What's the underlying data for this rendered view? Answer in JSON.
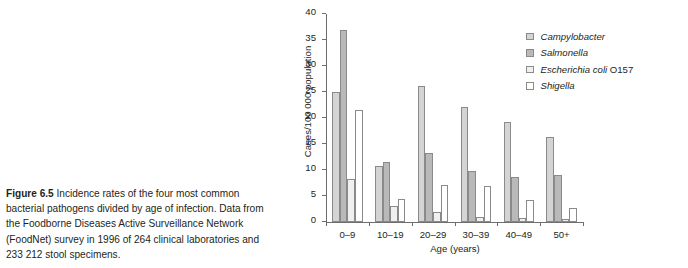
{
  "caption": {
    "label": "Figure 6.5",
    "text": " Incidence rates of the four most common bacterial pathogens divided by age of infection. Data from the Foodborne Diseases Active Surveillance Network (FoodNet) survey in 1996 of 264 clinical laboratories and 233 212 stool specimens."
  },
  "chart_data": {
    "type": "bar",
    "title": "",
    "xlabel": "Age (years)",
    "ylabel": "Cases/100 000 population",
    "categories": [
      "0–9",
      "10–19",
      "20–29",
      "30–39",
      "40–49",
      "50+"
    ],
    "ylim": [
      0,
      40
    ],
    "yticks": [
      0,
      5,
      10,
      15,
      20,
      25,
      30,
      35,
      40
    ],
    "ytick_labels": [
      "0",
      "5",
      "10",
      "15",
      "20",
      "25",
      "30",
      "35",
      "40"
    ],
    "grid": false,
    "legend_position": "top-right",
    "series": [
      {
        "name": "Campylobacter",
        "italic": true,
        "color": "#d4d4d4",
        "border": "#8a8a8a",
        "values": [
          25.0,
          10.8,
          26.2,
          22.1,
          19.2,
          16.3
        ]
      },
      {
        "name": "Salmonella",
        "italic": true,
        "color": "#b9b9b9",
        "border": "#8a8a8a",
        "values": [
          37.0,
          11.5,
          13.2,
          9.8,
          8.6,
          9.0
        ]
      },
      {
        "name": "Escherichia coli O157",
        "italic": true,
        "roman_suffix": " O157",
        "color": "#f0f0f0",
        "border": "#8a8a8a",
        "values": [
          8.3,
          3.1,
          1.9,
          0.9,
          0.7,
          0.6
        ]
      },
      {
        "name": "Shigella",
        "italic": true,
        "color": "#ffffff",
        "border": "#8a8a8a",
        "values": [
          21.5,
          4.5,
          7.2,
          6.9,
          4.2,
          2.6
        ]
      }
    ]
  },
  "legend": {
    "items": [
      {
        "label": "Campylobacter",
        "swatch": "#d4d4d4"
      },
      {
        "label": "Salmonella",
        "swatch": "#b9b9b9"
      },
      {
        "label": "Escherichia coli O157",
        "swatch": "#f0f0f0"
      },
      {
        "label": "Shigella",
        "swatch": "#ffffff"
      }
    ]
  }
}
